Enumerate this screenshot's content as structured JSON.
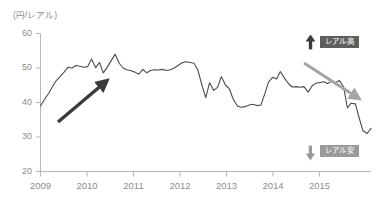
{
  "figure": {
    "unit_label": "(円/レアル)",
    "background_color": "#ffffff"
  },
  "annotations": {
    "up": {
      "label": "レアル高",
      "arrow_icon": "arrow-up-icon",
      "color": "#5e5e5e"
    },
    "down": {
      "label": "レアル安",
      "arrow_icon": "arrow-down-icon",
      "color": "#9a9a9a"
    },
    "trend_up": {
      "name": "rising-trend-arrow",
      "color": "#3a3a3a"
    },
    "trend_down": {
      "name": "falling-trend-arrow",
      "color": "#a6a6a6"
    }
  },
  "axes": {
    "y_ticks": [
      "60",
      "50",
      "40",
      "30",
      "20"
    ],
    "x_ticks": [
      "2009",
      "2010",
      "2011",
      "2012",
      "2013",
      "2014",
      "2015"
    ]
  },
  "chart_data": {
    "type": "line",
    "title": "",
    "subtitle": "",
    "xlabel": "",
    "ylabel": "(円/レアル)",
    "ylim": [
      20,
      60
    ],
    "xlim": [
      2009.0,
      2016.0
    ],
    "grid": false,
    "legend_position": "none",
    "line_color": "#4a4a4a",
    "y_tick_values": [
      20,
      30,
      40,
      50,
      60
    ],
    "x_tick_values": [
      2009,
      2010,
      2011,
      2012,
      2013,
      2014,
      2015
    ],
    "series": [
      {
        "name": "JPY per BRL",
        "x": [
          2009.0,
          2009.08,
          2009.17,
          2009.25,
          2009.33,
          2009.42,
          2009.5,
          2009.58,
          2009.67,
          2009.75,
          2009.83,
          2009.92,
          2010.0,
          2010.08,
          2010.17,
          2010.25,
          2010.33,
          2010.42,
          2010.5,
          2010.58,
          2010.67,
          2010.75,
          2010.83,
          2010.92,
          2011.0,
          2011.08,
          2011.17,
          2011.25,
          2011.33,
          2011.42,
          2011.5,
          2011.58,
          2011.67,
          2011.75,
          2011.83,
          2011.92,
          2012.0,
          2012.08,
          2012.17,
          2012.25,
          2012.33,
          2012.42,
          2012.5,
          2012.58,
          2012.67,
          2012.75,
          2012.83,
          2012.92,
          2013.0,
          2013.08,
          2013.17,
          2013.25,
          2013.33,
          2013.42,
          2013.5,
          2013.58,
          2013.67,
          2013.75,
          2013.83,
          2013.92,
          2014.0,
          2014.08,
          2014.17,
          2014.25,
          2014.33,
          2014.42,
          2014.5,
          2014.58,
          2014.67,
          2014.75,
          2014.83,
          2014.92,
          2015.0,
          2015.08,
          2015.17,
          2015.25,
          2015.33,
          2015.42,
          2015.5,
          2015.58,
          2015.67,
          2015.75,
          2015.83,
          2015.92,
          2016.0
        ],
        "values": [
          39.0,
          40.8,
          42.6,
          44.5,
          46.3,
          47.6,
          48.8,
          50.2,
          50.0,
          50.7,
          50.5,
          50.2,
          50.4,
          52.6,
          50.1,
          51.6,
          48.6,
          50.4,
          52.2,
          54.0,
          51.3,
          50.0,
          49.5,
          49.2,
          48.8,
          48.2,
          49.6,
          48.6,
          49.3,
          49.5,
          49.4,
          49.6,
          49.3,
          49.5,
          50.0,
          50.8,
          51.5,
          51.8,
          51.6,
          51.4,
          49.5,
          45.0,
          41.4,
          45.7,
          43.5,
          44.4,
          47.5,
          45.0,
          44.0,
          41.0,
          39.0,
          38.6,
          38.8,
          39.3,
          39.5,
          39.1,
          39.3,
          42.5,
          46.0,
          47.3,
          46.8,
          49.0,
          47.0,
          45.5,
          44.5,
          44.6,
          44.4,
          44.6,
          43.0,
          44.8,
          45.6,
          45.8,
          46.0,
          45.5,
          46.2,
          45.7,
          46.4,
          44.5,
          38.4,
          39.8,
          39.6,
          35.5,
          31.8,
          31.0,
          32.5
        ]
      }
    ],
    "annotation_arrows": [
      {
        "label": "rising-trend-arrow",
        "from": {
          "x": 2009.4,
          "y": 34.9
        },
        "to": {
          "x": 2010.4,
          "y": 46.8
        },
        "color": "#3a3a3a"
      },
      {
        "label": "falling-trend-arrow",
        "from": {
          "x": 2014.7,
          "y": 51.9
        },
        "to": {
          "x": 2015.9,
          "y": 42.3
        },
        "color": "#a6a6a6"
      }
    ],
    "annotation_labels": [
      {
        "text": "レアル高",
        "meaning": "real-strong",
        "position": "top-right",
        "color": "#5e5e5e"
      },
      {
        "text": "レアル安",
        "meaning": "real-weak",
        "position": "bottom-right",
        "color": "#9a9a9a"
      }
    ]
  }
}
